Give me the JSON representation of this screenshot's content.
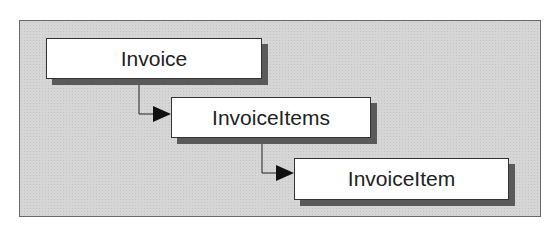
{
  "diagram": {
    "nodes": [
      {
        "id": "invoice",
        "label": "Invoice"
      },
      {
        "id": "invoice-items",
        "label": "InvoiceItems"
      },
      {
        "id": "invoice-item",
        "label": "InvoiceItem"
      }
    ],
    "edges": [
      {
        "from": "invoice",
        "to": "invoice-items"
      },
      {
        "from": "invoice-items",
        "to": "invoice-item"
      }
    ],
    "colors": {
      "panel_background": "#d6d6d6",
      "node_background": "#ffffff",
      "node_shadow": "#5a5a5a",
      "connector": "#222222"
    }
  }
}
